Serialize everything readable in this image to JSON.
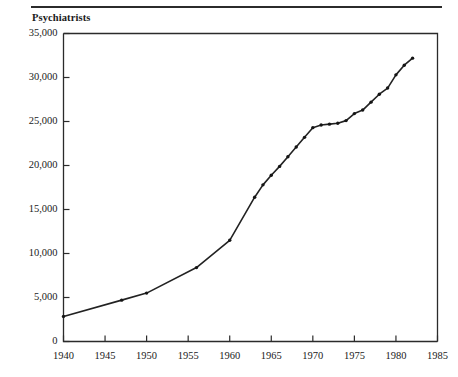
{
  "figure": {
    "title": "Psychiatrists",
    "rule_color": "#2b2b2b"
  },
  "chart_data": {
    "type": "line",
    "title": "Psychiatrists",
    "subtitle": "",
    "xlabel": "",
    "ylabel": "Psychiatrists",
    "xlim": [
      1940,
      1985
    ],
    "ylim": [
      0,
      35000
    ],
    "grid": false,
    "legend": null,
    "line_color": "#222222",
    "marker": "dot",
    "xticks": [
      1940,
      1945,
      1950,
      1955,
      1960,
      1965,
      1970,
      1975,
      1980,
      1985
    ],
    "xtick_labels": [
      "1940",
      "1945",
      "1950",
      "1955",
      "1960",
      "1965",
      "1970",
      "1975",
      "1980",
      "1985"
    ],
    "yticks": [
      0,
      5000,
      10000,
      15000,
      20000,
      25000,
      30000,
      35000
    ],
    "ytick_labels": [
      "0",
      "5,000",
      "10,000",
      "15,000",
      "20,000",
      "25,000",
      "30,000",
      "35,000"
    ],
    "x": [
      1940,
      1947,
      1950,
      1956,
      1960,
      1963,
      1964,
      1965,
      1966,
      1967,
      1968,
      1969,
      1970,
      1971,
      1972,
      1973,
      1974,
      1975,
      1976,
      1977,
      1978,
      1979,
      1980,
      1981,
      1982
    ],
    "y": [
      2850,
      4700,
      5500,
      8400,
      11500,
      16400,
      17800,
      18900,
      19900,
      21000,
      22100,
      23200,
      24300,
      24600,
      24700,
      24800,
      25100,
      25900,
      26300,
      27200,
      28100,
      28800,
      30300,
      31400,
      32200
    ],
    "series": [
      {
        "name": "Psychiatrists",
        "values": [
          2850,
          4700,
          5500,
          8400,
          11500,
          16400,
          17800,
          18900,
          19900,
          21000,
          22100,
          23200,
          24300,
          24600,
          24700,
          24800,
          25100,
          25900,
          26300,
          27200,
          28100,
          28800,
          30300,
          31400,
          32200
        ]
      }
    ]
  }
}
